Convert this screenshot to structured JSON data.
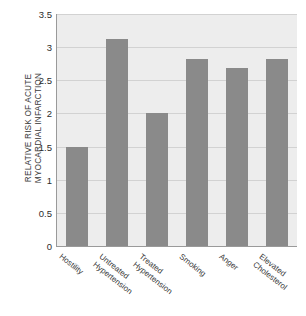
{
  "figure": {
    "title_faint": "",
    "background_color": "#ffffff",
    "plot_background_color": "#ededed",
    "bar_color": "#8a8a8a",
    "gridline_color": "#d2d2d2",
    "axis_color": "#9a9a9a"
  },
  "chart_data": {
    "type": "bar",
    "title": "",
    "xlabel": "",
    "ylabel": "RELATIVE RISK OF ACUTE MYOCARDIAL INFARCTION",
    "ylabel_lines": [
      "RELATIVE RISK OF ACUTE",
      "MYOCARDIAL INFARCTION"
    ],
    "categories": [
      "Hostility",
      "Untreated Hypertension",
      "Treated Hypertension",
      "Smoking",
      "Anger",
      "Elevated Cholesterol"
    ],
    "category_lines": [
      [
        "Hostility"
      ],
      [
        "Untreated",
        "Hypertension"
      ],
      [
        "Treated",
        "Hypertension"
      ],
      [
        "Smoking"
      ],
      [
        "Anger"
      ],
      [
        "Elevated",
        "Cholesterol"
      ]
    ],
    "values": [
      1.5,
      3.12,
      2.0,
      2.82,
      2.68,
      2.82
    ],
    "ylim": [
      0,
      3.5
    ],
    "yticks": [
      0,
      0.5,
      1,
      1.5,
      2,
      2.5,
      3,
      3.5
    ],
    "ytick_labels": [
      "0",
      "0.5",
      "1",
      "1.5",
      "2",
      "2.5",
      "3",
      "3.5"
    ],
    "grid": true,
    "legend": null,
    "legend_position": "none"
  }
}
